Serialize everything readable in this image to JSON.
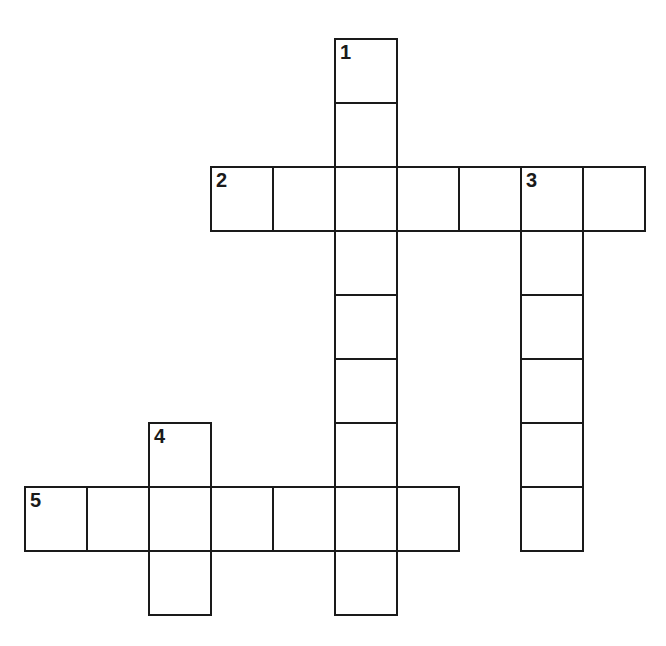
{
  "puzzle": {
    "type": "crossword",
    "origin": {
      "x": 24,
      "y": 38
    },
    "cell_size": {
      "w": 62,
      "h": 64
    },
    "line_color": "#1a1a1a",
    "background": "#ffffff",
    "words": [
      {
        "number": "1",
        "direction": "down",
        "row": 0,
        "col": 5,
        "length": 9
      },
      {
        "number": "2",
        "direction": "across",
        "row": 2,
        "col": 3,
        "length": 7
      },
      {
        "number": "3",
        "direction": "down",
        "row": 2,
        "col": 8,
        "length": 6
      },
      {
        "number": "4",
        "direction": "down",
        "row": 6,
        "col": 2,
        "length": 3
      },
      {
        "number": "5",
        "direction": "across",
        "row": 7,
        "col": 0,
        "length": 7
      }
    ]
  }
}
